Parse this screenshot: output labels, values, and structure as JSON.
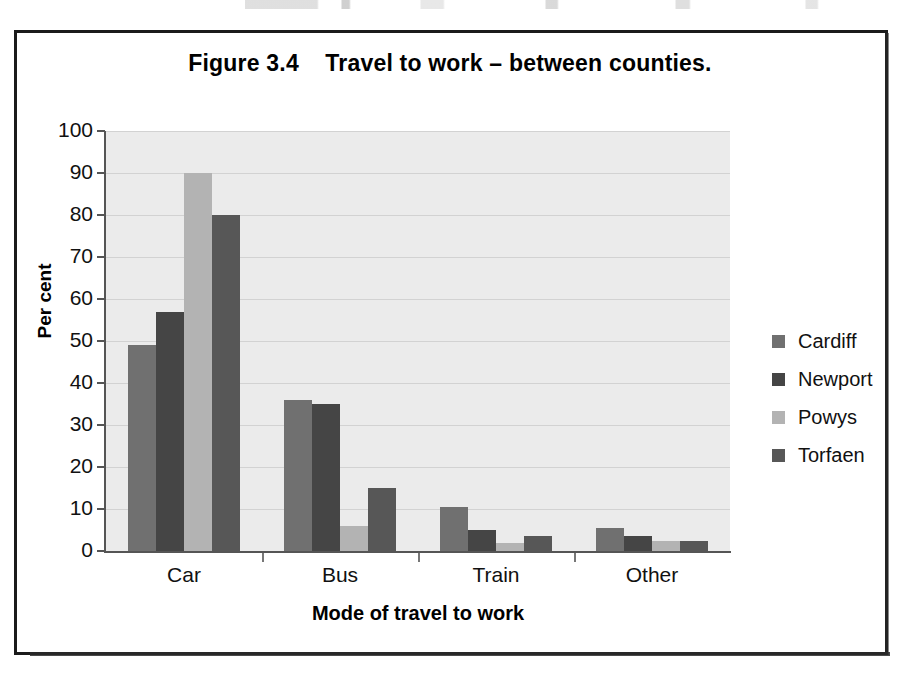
{
  "figure": {
    "title": "Figure 3.4    Travel to work – between counties."
  },
  "chart_data": {
    "type": "bar",
    "title": "Figure 3.4    Travel to work – between counties.",
    "xlabel": "Mode of travel to work",
    "ylabel": "Per cent",
    "categories": [
      "Car",
      "Bus",
      "Train",
      "Other"
    ],
    "series": [
      {
        "name": "Cardiff",
        "color": "#707070",
        "values": [
          49,
          36,
          10.5,
          5.5
        ]
      },
      {
        "name": "Newport",
        "color": "#454545",
        "values": [
          57,
          35,
          5,
          3.5
        ]
      },
      {
        "name": "Powys",
        "color": "#b3b3b3",
        "values": [
          90,
          6,
          2,
          2.5
        ]
      },
      {
        "name": "Torfaen",
        "color": "#575757",
        "values": [
          80,
          15,
          3.5,
          2.5
        ]
      }
    ],
    "ylim": [
      0,
      100
    ],
    "yticks": [
      0,
      10,
      20,
      30,
      40,
      50,
      60,
      70,
      80,
      90,
      100
    ],
    "ytick_labels": [
      "0",
      "10",
      "20",
      "30",
      "40",
      "50",
      "60",
      "70",
      "80",
      "90",
      "100"
    ],
    "grid": "horizontal",
    "legend_position": "right",
    "plot_background": "#ebebeb",
    "gridline_color": "#d2d2d2"
  }
}
